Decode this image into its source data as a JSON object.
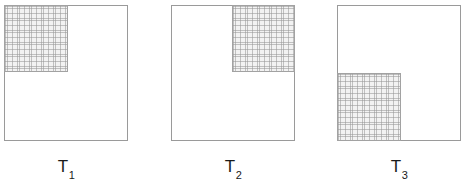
{
  "figure": {
    "background_color": "#ffffff",
    "width": 460,
    "height": 187,
    "outline_color": "#9a9a9a",
    "shade_fill_color": "#f2f2f2",
    "shade_hatch_color": "#969696",
    "shade_border_color": "#a2a2a2",
    "label_color": "#1a1a1a"
  },
  "panels": [
    {
      "id": "panel-1",
      "label_base": "T",
      "label_subscript": "1",
      "label_full": "T1",
      "square": {
        "x": 4,
        "y": 5,
        "width": 124,
        "height": 136
      },
      "shaded_region": {
        "corner": "top-left",
        "x": 4,
        "y": 5,
        "width": 64,
        "height": 67
      }
    },
    {
      "id": "panel-2",
      "label_base": "T",
      "label_subscript": "2",
      "label_full": "T2",
      "square": {
        "x": 171,
        "y": 5,
        "width": 124,
        "height": 136
      },
      "shaded_region": {
        "corner": "top-right",
        "x": 232,
        "y": 5,
        "width": 63,
        "height": 67
      }
    },
    {
      "id": "panel-3",
      "label_base": "T",
      "label_subscript": "3",
      "label_full": "T3",
      "square": {
        "x": 337,
        "y": 5,
        "width": 124,
        "height": 136
      },
      "shaded_region": {
        "corner": "bottom-left",
        "x": 337,
        "y": 73,
        "width": 64,
        "height": 68
      }
    }
  ]
}
